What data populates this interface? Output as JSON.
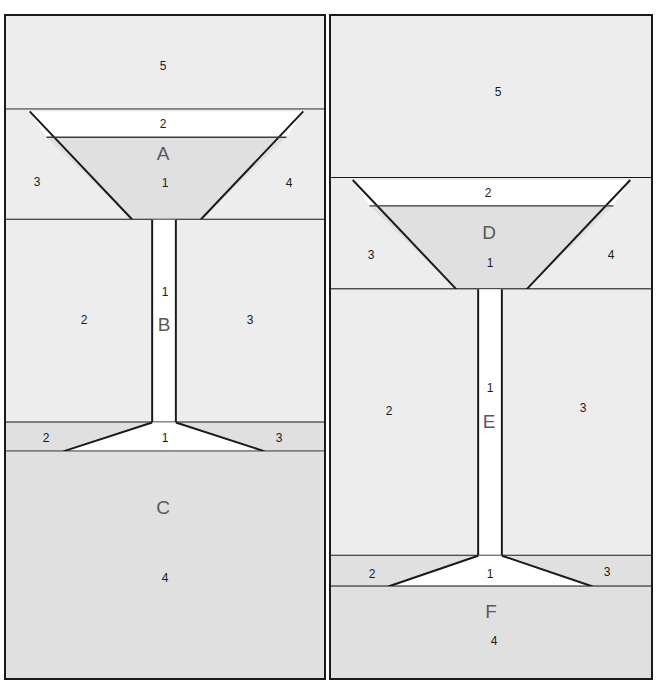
{
  "diagram": {
    "background": "#ffffff",
    "border_color": "#1a1a1a",
    "fill_light": "#ededed",
    "fill_dark": "#e0e0e0",
    "fill_void": "#ffffff",
    "label_color": "#1b1b1b",
    "section_letter_color": "#595959"
  },
  "columns": [
    {
      "name": "left-column",
      "sections": [
        {
          "id": "A",
          "letter": "A",
          "shape": "funnel",
          "numbers": [
            {
              "value": "5",
              "x": 163,
              "y": 66
            },
            {
              "value": "2",
              "x": 163,
              "y": 124
            },
            {
              "value": "3",
              "x": 37,
              "y": 182
            },
            {
              "value": "1",
              "x": 165,
              "y": 183
            },
            {
              "value": "4",
              "x": 289,
              "y": 183
            }
          ],
          "letter_pos": {
            "x": 163,
            "y": 153
          }
        },
        {
          "id": "B",
          "letter": "B",
          "shape": "vertical-channel",
          "numbers": [
            {
              "value": "1",
              "x": 165,
              "y": 292
            },
            {
              "value": "2",
              "x": 84,
              "y": 320
            },
            {
              "value": "3",
              "x": 250,
              "y": 320
            }
          ],
          "letter_pos": {
            "x": 164,
            "y": 324
          }
        },
        {
          "id": "C",
          "letter": "C",
          "shape": "flared-base",
          "numbers": [
            {
              "value": "2",
              "x": 46,
              "y": 438
            },
            {
              "value": "1",
              "x": 165,
              "y": 438
            },
            {
              "value": "3",
              "x": 279,
              "y": 438
            },
            {
              "value": "4",
              "x": 165,
              "y": 578
            }
          ],
          "letter_pos": {
            "x": 163,
            "y": 507
          }
        }
      ]
    },
    {
      "name": "right-column",
      "sections": [
        {
          "id": "D",
          "letter": "D",
          "shape": "funnel",
          "numbers": [
            {
              "value": "5",
              "x": 498,
              "y": 92
            },
            {
              "value": "2",
              "x": 488,
              "y": 193
            },
            {
              "value": "3",
              "x": 371,
              "y": 255
            },
            {
              "value": "1",
              "x": 490,
              "y": 263
            },
            {
              "value": "4",
              "x": 611,
              "y": 255
            }
          ],
          "letter_pos": {
            "x": 489,
            "y": 232
          }
        },
        {
          "id": "E",
          "letter": "E",
          "shape": "vertical-channel",
          "numbers": [
            {
              "value": "1",
              "x": 490,
              "y": 388
            },
            {
              "value": "2",
              "x": 389,
              "y": 411
            },
            {
              "value": "3",
              "x": 583,
              "y": 408
            }
          ],
          "letter_pos": {
            "x": 489,
            "y": 421
          }
        },
        {
          "id": "F",
          "letter": "F",
          "shape": "flared-base",
          "numbers": [
            {
              "value": "2",
              "x": 372,
              "y": 574
            },
            {
              "value": "1",
              "x": 490,
              "y": 574
            },
            {
              "value": "3",
              "x": 607,
              "y": 572
            },
            {
              "value": "4",
              "x": 494,
              "y": 641
            }
          ],
          "letter_pos": {
            "x": 491,
            "y": 611
          }
        }
      ]
    }
  ],
  "legend_numbers": [
    "1",
    "2",
    "3",
    "4",
    "5"
  ]
}
